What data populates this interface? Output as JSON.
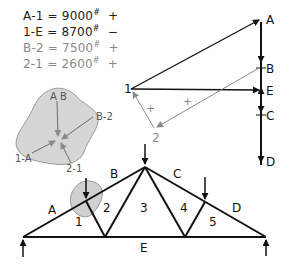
{
  "equations": [
    {
      "member": "A-1",
      "value": "9000",
      "unit": "#",
      "sign": "+",
      "tone": "dark"
    },
    {
      "member": "1-E",
      "value": "8700",
      "unit": "#",
      "sign": "−",
      "tone": "dark"
    },
    {
      "member": "B-2",
      "value": "7500",
      "unit": "#",
      "sign": "+",
      "tone": "light"
    },
    {
      "member": "2-1",
      "value": "2600",
      "unit": "#",
      "sign": "+",
      "tone": "light"
    }
  ],
  "force_polygon": {
    "load_line_labels": {
      "A": "A",
      "B": "B",
      "E": "E",
      "C": "C",
      "D": "D"
    },
    "node_labels": {
      "n1": "1",
      "n2": "2"
    },
    "sign_marks": [
      "+",
      "+"
    ]
  },
  "joint_free_body": {
    "labels": {
      "ab": "A B",
      "b2": "B-2",
      "oneA": "1-A",
      "twoOne": "2-1"
    }
  },
  "truss": {
    "space_labels": {
      "A": "A",
      "B": "B",
      "C": "C",
      "D": "D",
      "E": "E",
      "p1": "1",
      "p2": "2",
      "p3": "3",
      "p4": "4",
      "p5": "5"
    }
  },
  "colors": {
    "dark": "#111111",
    "light": "#8a8a8a",
    "blob": "#d6d6d6"
  }
}
